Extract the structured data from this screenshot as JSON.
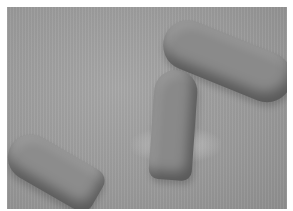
{
  "image": {
    "description": "Grayscale photograph of three capsule-shaped objects on a gray surface; the center one is upright with a fluffy fibrous mass around its base.",
    "colors": {
      "border": "#ffffff",
      "background": "#9c9c9c",
      "objects": "#8a8a8a"
    },
    "objects": [
      {
        "name": "top-right-capsule",
        "orientation": "diagonal, partially cropped at right edge"
      },
      {
        "name": "left-capsule",
        "orientation": "diagonal, lower left"
      },
      {
        "name": "center-capsule",
        "orientation": "upright with fibrous material at base"
      }
    ]
  }
}
